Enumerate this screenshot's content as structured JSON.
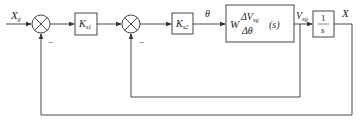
{
  "diagram": {
    "type": "block-diagram",
    "input": {
      "symbol": "X",
      "subscript": "g"
    },
    "output": {
      "symbol": "X"
    },
    "signals": {
      "theta": "θ",
      "velocity": {
        "symbol": "V",
        "subscript": "xg"
      }
    },
    "blocks": [
      {
        "id": "kx1",
        "symbol": "K",
        "subscript": "x1"
      },
      {
        "id": "kx2",
        "symbol": "K",
        "subscript": "x2"
      },
      {
        "id": "plant",
        "prefix": "W",
        "numerator": "ΔV",
        "numerator_sub": "xg",
        "denominator": "Δθ",
        "suffix": "(s)"
      },
      {
        "id": "integrator",
        "numerator": "1",
        "denominator": "s"
      }
    ],
    "summing_junctions": [
      {
        "id": "sum1",
        "feedback_sign": "−"
      },
      {
        "id": "sum2",
        "feedback_sign": "−"
      }
    ],
    "feedback_loops": [
      {
        "from": "X",
        "to": "sum1",
        "label": "outer position loop"
      },
      {
        "from": "V_xg",
        "to": "sum2",
        "label": "inner velocity loop"
      }
    ]
  }
}
